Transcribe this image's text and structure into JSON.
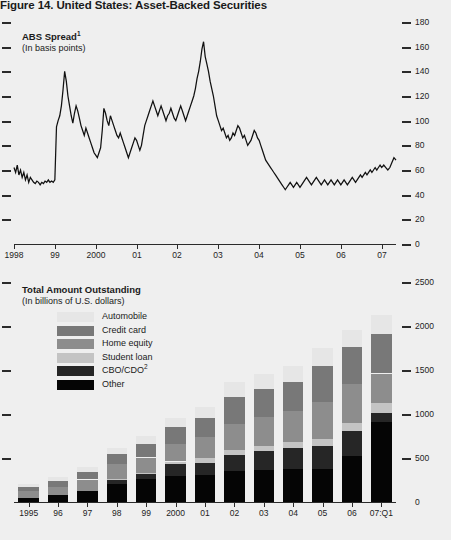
{
  "figure": {
    "title": "Figure 14. United States: Asset-Backed Securities"
  },
  "colors": {
    "background": "#efefef",
    "axis": "#2b2b2b",
    "line": "#111111",
    "automobile": "#e6e6e6",
    "credit_card": "#787878",
    "home_equity": "#8d8d8d",
    "student_loan": "#c4c4c4",
    "cbo_cdo": "#262626",
    "other": "#050505"
  },
  "panel_top": {
    "title": "ABS Spread",
    "title_footnote": "1",
    "subtitle": "(In basis points)"
  },
  "panel_bottom": {
    "title": "Total Amount Outstanding",
    "subtitle": "(In billions of U.S. dollars)",
    "legend": [
      {
        "label": "Automobile",
        "key": "automobile"
      },
      {
        "label": "Credit card",
        "key": "credit_card"
      },
      {
        "label": "Home equity",
        "key": "home_equity"
      },
      {
        "label": "Student loan",
        "key": "student_loan"
      },
      {
        "label": "CBO/CDO",
        "key": "cbo_cdo",
        "footnote": "2"
      },
      {
        "label": "Other",
        "key": "other"
      }
    ]
  },
  "chart_data": [
    {
      "type": "line",
      "id": "abs-spread",
      "title": "ABS Spread",
      "subtitle": "(In basis points)",
      "xlabel": "",
      "ylabel": "Basis points",
      "ylim": [
        0,
        180
      ],
      "ytick_values": [
        0,
        20,
        40,
        60,
        80,
        100,
        120,
        140,
        160,
        180
      ],
      "ytick_labels": [
        "0",
        "20",
        "40",
        "60",
        "80",
        "100",
        "120",
        "140",
        "160",
        "180"
      ],
      "grid": false,
      "legend_position": "none",
      "xtick_labels": [
        "1998",
        "99",
        "2000",
        "01",
        "02",
        "03",
        "04",
        "05",
        "06",
        "07"
      ],
      "xlim": [
        1998.0,
        2007.35
      ],
      "series": [
        {
          "name": "ABS spread",
          "color": "#111111",
          "x": [
            1998.0,
            1998.04,
            1998.08,
            1998.12,
            1998.16,
            1998.2,
            1998.24,
            1998.28,
            1998.32,
            1998.36,
            1998.4,
            1998.44,
            1998.48,
            1998.52,
            1998.56,
            1998.6,
            1998.64,
            1998.68,
            1998.72,
            1998.76,
            1998.8,
            1998.84,
            1998.88,
            1998.92,
            1998.96,
            1999.0,
            1999.04,
            1999.08,
            1999.12,
            1999.16,
            1999.2,
            1999.24,
            1999.28,
            1999.32,
            1999.36,
            1999.4,
            1999.44,
            1999.48,
            1999.52,
            1999.56,
            1999.6,
            1999.64,
            1999.68,
            1999.72,
            1999.76,
            1999.8,
            1999.84,
            1999.88,
            1999.92,
            1999.96,
            2000.0,
            2000.04,
            2000.08,
            2000.12,
            2000.16,
            2000.2,
            2000.24,
            2000.28,
            2000.32,
            2000.36,
            2000.4,
            2000.44,
            2000.48,
            2000.52,
            2000.56,
            2000.6,
            2000.64,
            2000.68,
            2000.72,
            2000.76,
            2000.8,
            2000.84,
            2000.88,
            2000.92,
            2000.96,
            2001.0,
            2001.04,
            2001.08,
            2001.12,
            2001.16,
            2001.2,
            2001.24,
            2001.28,
            2001.32,
            2001.36,
            2001.4,
            2001.44,
            2001.48,
            2001.52,
            2001.56,
            2001.6,
            2001.64,
            2001.68,
            2001.72,
            2001.76,
            2001.8,
            2001.84,
            2001.88,
            2001.92,
            2001.96,
            2002.0,
            2002.04,
            2002.08,
            2002.12,
            2002.16,
            2002.2,
            2002.24,
            2002.28,
            2002.32,
            2002.36,
            2002.4,
            2002.44,
            2002.48,
            2002.52,
            2002.56,
            2002.6,
            2002.64,
            2002.68,
            2002.72,
            2002.76,
            2002.8,
            2002.84,
            2002.88,
            2002.92,
            2002.96,
            2003.0,
            2003.04,
            2003.08,
            2003.12,
            2003.16,
            2003.2,
            2003.24,
            2003.28,
            2003.32,
            2003.36,
            2003.4,
            2003.44,
            2003.48,
            2003.52,
            2003.56,
            2003.6,
            2003.64,
            2003.68,
            2003.72,
            2003.76,
            2003.8,
            2003.84,
            2003.88,
            2003.92,
            2003.96,
            2004.0,
            2004.04,
            2004.08,
            2004.12,
            2004.16,
            2004.2,
            2004.24,
            2004.28,
            2004.32,
            2004.36,
            2004.4,
            2004.44,
            2004.48,
            2004.52,
            2004.56,
            2004.6,
            2004.64,
            2004.68,
            2004.72,
            2004.76,
            2004.8,
            2004.84,
            2004.88,
            2004.92,
            2004.96,
            2005.0,
            2005.04,
            2005.08,
            2005.12,
            2005.16,
            2005.2,
            2005.24,
            2005.28,
            2005.32,
            2005.36,
            2005.4,
            2005.44,
            2005.48,
            2005.52,
            2005.56,
            2005.6,
            2005.64,
            2005.68,
            2005.72,
            2005.76,
            2005.8,
            2005.84,
            2005.88,
            2005.92,
            2005.96,
            2006.0,
            2006.04,
            2006.08,
            2006.12,
            2006.16,
            2006.2,
            2006.24,
            2006.28,
            2006.32,
            2006.36,
            2006.4,
            2006.44,
            2006.48,
            2006.52,
            2006.56,
            2006.6,
            2006.64,
            2006.68,
            2006.72,
            2006.76,
            2006.8,
            2006.84,
            2006.88,
            2006.92,
            2006.96,
            2007.0,
            2007.05,
            2007.1,
            2007.15,
            2007.2,
            2007.25,
            2007.3,
            2007.35
          ],
          "y": [
            62,
            58,
            64,
            56,
            60,
            54,
            58,
            52,
            56,
            50,
            54,
            52,
            50,
            49,
            51,
            50,
            48,
            50,
            49,
            51,
            50,
            52,
            50,
            51,
            50,
            52,
            95,
            100,
            104,
            112,
            125,
            140,
            132,
            120,
            112,
            104,
            98,
            106,
            112,
            108,
            102,
            96,
            92,
            88,
            94,
            90,
            86,
            82,
            78,
            74,
            72,
            70,
            74,
            78,
            92,
            110,
            106,
            100,
            96,
            104,
            100,
            96,
            92,
            88,
            86,
            90,
            86,
            82,
            78,
            74,
            70,
            74,
            78,
            82,
            86,
            84,
            80,
            76,
            80,
            88,
            96,
            100,
            104,
            108,
            112,
            116,
            112,
            108,
            104,
            108,
            112,
            108,
            104,
            100,
            104,
            106,
            110,
            106,
            102,
            100,
            104,
            108,
            112,
            108,
            104,
            100,
            104,
            108,
            112,
            116,
            120,
            126,
            134,
            140,
            148,
            158,
            164,
            152,
            146,
            140,
            132,
            126,
            120,
            112,
            104,
            100,
            96,
            92,
            94,
            90,
            86,
            88,
            84,
            86,
            90,
            88,
            92,
            96,
            94,
            90,
            86,
            88,
            84,
            80,
            82,
            84,
            88,
            92,
            90,
            86,
            84,
            80,
            76,
            72,
            68,
            66,
            64,
            62,
            60,
            58,
            56,
            54,
            52,
            50,
            48,
            46,
            44,
            46,
            48,
            50,
            48,
            46,
            48,
            50,
            48,
            46,
            48,
            50,
            52,
            54,
            52,
            50,
            48,
            50,
            52,
            54,
            52,
            50,
            48,
            50,
            52,
            50,
            48,
            50,
            52,
            50,
            48,
            50,
            52,
            50,
            48,
            50,
            52,
            50,
            48,
            50,
            52,
            54,
            52,
            50,
            52,
            54,
            56,
            54,
            56,
            58,
            56,
            58,
            60,
            58,
            60,
            62,
            60,
            62,
            64,
            62,
            64,
            62,
            60,
            62,
            66,
            70,
            68
          ]
        }
      ]
    },
    {
      "type": "bar",
      "id": "total-amount-outstanding",
      "stacked": true,
      "title": "Total Amount Outstanding",
      "subtitle": "(In billions of U.S. dollars)",
      "xlabel": "",
      "ylabel": "Billions of U.S. dollars",
      "ylim": [
        0,
        2500
      ],
      "ytick_values": [
        0,
        500,
        1000,
        1500,
        2000,
        2500
      ],
      "ytick_labels": [
        "0",
        "500",
        "1000",
        "1500",
        "2000",
        "2500"
      ],
      "grid": false,
      "legend_position": "upper-left",
      "categories": [
        "1995",
        "96",
        "97",
        "98",
        "99",
        "2000",
        "01",
        "02",
        "03",
        "04",
        "05",
        "06",
        "07:Q1"
      ],
      "series": [
        {
          "name": "Other",
          "color": "#050505",
          "values": [
            45,
            75,
            125,
            205,
            265,
            300,
            310,
            350,
            360,
            375,
            380,
            520,
            910
          ]
        },
        {
          "name": "CBO/CDO",
          "color": "#262626",
          "values": [
            0,
            0,
            0,
            40,
            55,
            130,
            135,
            185,
            220,
            235,
            260,
            290,
            100
          ]
        },
        {
          "name": "Student loan",
          "color": "#c4c4c4",
          "values": [
            0,
            0,
            0,
            15,
            15,
            30,
            55,
            55,
            60,
            70,
            75,
            90,
            110
          ]
        },
        {
          "name": "Home equity",
          "color": "#8d8d8d",
          "values": [
            80,
            95,
            130,
            170,
            170,
            200,
            240,
            300,
            330,
            355,
            420,
            440,
            340
          ]
        },
        {
          "name": "Credit card",
          "color": "#787878",
          "values": [
            45,
            75,
            90,
            115,
            155,
            190,
            215,
            305,
            310,
            325,
            410,
            420,
            450
          ]
        },
        {
          "name": "Automobile",
          "color": "#e6e6e6",
          "values": [
            35,
            45,
            50,
            65,
            95,
            105,
            130,
            170,
            170,
            185,
            200,
            200,
            210
          ]
        }
      ],
      "totals": [
        205,
        290,
        395,
        610,
        755,
        955,
        1085,
        1365,
        1450,
        1545,
        1745,
        1960,
        2120
      ]
    }
  ]
}
